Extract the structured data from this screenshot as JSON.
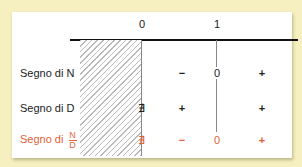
{
  "diagram": {
    "axis_ticks": [
      {
        "label": "0",
        "x": 142
      },
      {
        "label": "1",
        "x": 216
      }
    ],
    "rows": [
      {
        "label": "Segno di N",
        "signs": [
          "",
          "−",
          "0",
          "+"
        ]
      },
      {
        "label": "Segno di D",
        "signs": [
          "∄",
          "+",
          "",
          "+"
        ]
      },
      {
        "label": "Segno di",
        "fraction": {
          "num": "N",
          "den": "D"
        },
        "signs": [
          "∄",
          "−",
          "0",
          "+"
        ]
      }
    ],
    "colors": {
      "background": "#f6efc0",
      "result": "#e0623a",
      "text": "#222222"
    }
  }
}
